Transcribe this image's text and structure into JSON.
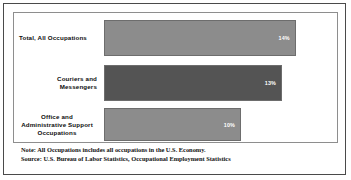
{
  "chart_data": {
    "type": "bar",
    "orientation": "horizontal",
    "title": "",
    "xlabel": "",
    "ylabel": "",
    "categories": [
      "Total, All Occupations",
      "Couriers and Messengers",
      "Office and Administrative Support Occupations"
    ],
    "values": [
      14,
      13,
      10
    ],
    "value_labels": [
      "14%",
      "13%",
      "10%"
    ],
    "xlim": [
      0,
      16
    ],
    "grid": false,
    "legend": "none",
    "series": [
      {
        "name": "Percent",
        "values": [
          14,
          13,
          10
        ]
      }
    ],
    "bar_colors": [
      "#8c8c8c",
      "#545454",
      "#8c8c8c"
    ],
    "value_label_colors": [
      "#ffffff",
      "#ffffff",
      "#ffffff"
    ],
    "annotations": [
      "Note: All Occupations includes all occupations in the U.S. Economy.",
      "Source: U.S. Bureau of Labor Statistics, Occupational Employment Statistics"
    ]
  },
  "chart": {
    "bars": [
      {
        "label_line1": "Total, All Occupations",
        "label_line2": "",
        "label_line3": "",
        "value_label": "14%",
        "align": "align-left"
      },
      {
        "label_line1": "Couriers and",
        "label_line2": "Messengers",
        "label_line3": "",
        "value_label": "13%",
        "align": "align-right"
      },
      {
        "label_line1": "Office and",
        "label_line2": "Administrative Support",
        "label_line3": "Occupations",
        "value_label": "10%",
        "align": "align-center"
      }
    ]
  },
  "footnote": {
    "note": "Note: All Occupations includes all occupations in the U.S. Economy.",
    "source": "Source: U.S. Bureau of Labor Statistics, Occupational Employment Statistics"
  },
  "colors": {
    "bar_light": "#8c8c8c",
    "bar_dark": "#545454",
    "bar_border": "#6d6d6d",
    "frame": "#4a4a4a",
    "plot_border": "#8e8e8e",
    "text": "#0d0d0d",
    "value_text": "#ffffff",
    "background": "#ffffff"
  }
}
